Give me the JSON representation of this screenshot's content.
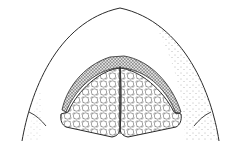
{
  "figure": {
    "type": "scientific-line-drawing",
    "colors": {
      "background": "#ffffff",
      "ink": "#2a2a2a",
      "stipple": "#555555"
    },
    "parts": [
      {
        "name": "outer-dome-outline"
      },
      {
        "name": "left-lateral-fold"
      },
      {
        "name": "right-lateral-fold"
      },
      {
        "name": "beaded-border-band"
      },
      {
        "name": "left-granular-pad"
      },
      {
        "name": "right-granular-pad"
      },
      {
        "name": "median-suture"
      }
    ]
  }
}
